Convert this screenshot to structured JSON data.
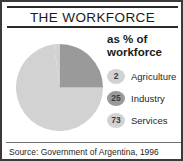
{
  "title": "THE WORKFORCE",
  "legend_heading_line1": "as % of",
  "legend_heading_line2": "workforce",
  "source": "Source: Government of Argentina, 1996",
  "colors": {
    "slice_services": "#d2d2d2",
    "slice_industry": "#9a9a9a",
    "slice_agriculture": "#d2d2d2",
    "badge_light": "#d2d2d2",
    "badge_dark": "#9a9a9a",
    "frame": "#3a3a3a",
    "rule": "#6e6e6e",
    "text": "#1a1a1a"
  },
  "chart_data": {
    "type": "pie",
    "title": "THE WORKFORCE",
    "subtitle": "as % of workforce",
    "unit": "%",
    "categories": [
      "Agriculture",
      "Industry",
      "Services"
    ],
    "values": [
      2,
      25,
      73
    ],
    "slice_colors": [
      "#d2d2d2",
      "#9a9a9a",
      "#d2d2d2"
    ],
    "legend": [
      {
        "value": "2",
        "label": "Agriculture",
        "color": "#d2d2d2",
        "tone": "light"
      },
      {
        "value": "25",
        "label": "Industry",
        "color": "#9a9a9a",
        "tone": "dark"
      },
      {
        "value": "73",
        "label": "Services",
        "color": "#d2d2d2",
        "tone": "light"
      }
    ],
    "legend_position": "right",
    "start_angle_deg": 0,
    "direction": "clockwise",
    "grid": false,
    "source": "Source: Government of Argentina, 1996"
  }
}
